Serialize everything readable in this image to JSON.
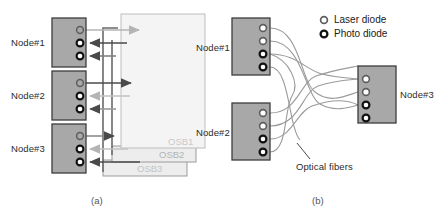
{
  "figure": {
    "panels": [
      {
        "id": "a",
        "caption": "(a)",
        "nodes": [
          {
            "label": "Node#1",
            "diodes": [
              "laser-diode",
              "photo-diode",
              "photo-diode"
            ]
          },
          {
            "label": "Node#2",
            "diodes": [
              "laser-diode",
              "photo-diode",
              "photo-diode"
            ]
          },
          {
            "label": "Node#3",
            "diodes": [
              "laser-diode",
              "photo-diode",
              "photo-diode"
            ]
          }
        ],
        "switch_boxes": [
          {
            "label": "OSB1"
          },
          {
            "label": "OSB2"
          },
          {
            "label": "OSB3"
          }
        ]
      },
      {
        "id": "b",
        "caption": "(b)",
        "nodes": [
          {
            "label": "Node#1",
            "diodes": [
              "laser-diode",
              "laser-diode",
              "photo-diode",
              "photo-diode"
            ]
          },
          {
            "label": "Node#2",
            "diodes": [
              "laser-diode",
              "laser-diode",
              "photo-diode",
              "photo-diode"
            ]
          },
          {
            "label": "Node#3",
            "diodes": [
              "laser-diode",
              "laser-diode",
              "photo-diode",
              "photo-diode"
            ]
          }
        ],
        "annotation": "Optical fibers"
      }
    ],
    "legend": {
      "items": [
        {
          "icon": "laser-diode-icon",
          "label": "Laser diode"
        },
        {
          "icon": "photo-diode-icon",
          "label": "Photo diode"
        }
      ]
    }
  },
  "colors": {
    "node_fill": "#a8a8a8",
    "node_stroke": "#3c3c3c",
    "osb_fill": "#ededed",
    "osb_stroke": "#9a9a9a",
    "osb_label": "#c9c9c9",
    "arrow_dark": "#4a4a4a",
    "arrow_light": "#b0b0b0",
    "fiber": "#9b9b9b",
    "text": "#2b2b2b"
  }
}
